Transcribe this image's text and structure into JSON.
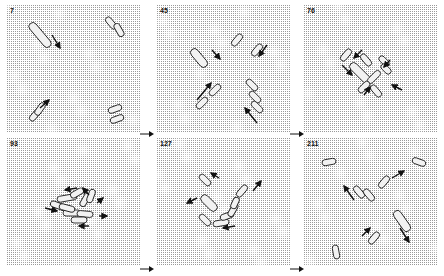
{
  "figure": {
    "background": "#ffffff",
    "stipple_color": "#9a9a9a",
    "cell_stroke": "#222222",
    "arrow_color": "#111111",
    "panels": [
      {
        "label": "7",
        "x": 7,
        "y": 5,
        "cells": [
          {
            "cx": 33,
            "cy": 30,
            "w": 8,
            "h": 30,
            "angle": -40
          },
          {
            "cx": 104,
            "cy": 18,
            "w": 6,
            "h": 14,
            "angle": -40
          },
          {
            "cx": 112,
            "cy": 25,
            "w": 6,
            "h": 14,
            "angle": -30
          },
          {
            "cx": 28,
            "cy": 110,
            "w": 6,
            "h": 14,
            "angle": 40
          },
          {
            "cx": 33,
            "cy": 104,
            "w": 6,
            "h": 14,
            "angle": 35
          },
          {
            "cx": 108,
            "cy": 104,
            "w": 6,
            "h": 14,
            "angle": 70
          },
          {
            "cx": 110,
            "cy": 114,
            "w": 6,
            "h": 14,
            "angle": 70
          }
        ],
        "arrows": [
          {
            "x1": 45,
            "y1": 30,
            "x2": 53,
            "y2": 43
          },
          {
            "x1": 33,
            "y1": 103,
            "x2": 42,
            "y2": 95
          }
        ]
      },
      {
        "label": "45",
        "x": 157,
        "y": 5,
        "cells": [
          {
            "cx": 42,
            "cy": 53,
            "w": 8,
            "h": 22,
            "angle": -40
          },
          {
            "cx": 80,
            "cy": 35,
            "w": 6,
            "h": 14,
            "angle": 40
          },
          {
            "cx": 100,
            "cy": 45,
            "w": 6,
            "h": 14,
            "angle": 40
          },
          {
            "cx": 45,
            "cy": 98,
            "w": 6,
            "h": 14,
            "angle": 45
          },
          {
            "cx": 58,
            "cy": 85,
            "w": 6,
            "h": 14,
            "angle": 45
          },
          {
            "cx": 95,
            "cy": 80,
            "w": 6,
            "h": 14,
            "angle": -45
          },
          {
            "cx": 98,
            "cy": 92,
            "w": 6,
            "h": 14,
            "angle": -45
          },
          {
            "cx": 100,
            "cy": 102,
            "w": 6,
            "h": 14,
            "angle": -45
          }
        ],
        "arrows": [
          {
            "x1": 55,
            "y1": 45,
            "x2": 63,
            "y2": 54
          },
          {
            "x1": 110,
            "y1": 40,
            "x2": 102,
            "y2": 51
          },
          {
            "x1": 40,
            "y1": 95,
            "x2": 54,
            "y2": 78
          },
          {
            "x1": 100,
            "y1": 118,
            "x2": 88,
            "y2": 103
          }
        ]
      },
      {
        "label": "76",
        "x": 304,
        "y": 5,
        "cells": [
          {
            "cx": 56,
            "cy": 68,
            "w": 8,
            "h": 26,
            "angle": -45
          },
          {
            "cx": 42,
            "cy": 50,
            "w": 6,
            "h": 14,
            "angle": 40
          },
          {
            "cx": 62,
            "cy": 55,
            "w": 6,
            "h": 14,
            "angle": -40
          },
          {
            "cx": 70,
            "cy": 72,
            "w": 6,
            "h": 16,
            "angle": 45
          },
          {
            "cx": 60,
            "cy": 82,
            "w": 6,
            "h": 14,
            "angle": 45
          },
          {
            "cx": 72,
            "cy": 86,
            "w": 6,
            "h": 14,
            "angle": -40
          },
          {
            "cx": 80,
            "cy": 56,
            "w": 6,
            "h": 12,
            "angle": -45
          },
          {
            "cx": 82,
            "cy": 64,
            "w": 6,
            "h": 12,
            "angle": -45
          }
        ],
        "arrows": [
          {
            "x1": 38,
            "y1": 60,
            "x2": 48,
            "y2": 70
          },
          {
            "x1": 58,
            "y1": 45,
            "x2": 50,
            "y2": 53
          },
          {
            "x1": 86,
            "y1": 55,
            "x2": 80,
            "y2": 62
          },
          {
            "x1": 98,
            "y1": 85,
            "x2": 88,
            "y2": 80
          },
          {
            "x1": 60,
            "y1": 90,
            "x2": 66,
            "y2": 82
          }
        ]
      },
      {
        "label": "93",
        "x": 7,
        "y": 138,
        "cells": [
          {
            "cx": 60,
            "cy": 60,
            "w": 6,
            "h": 20,
            "angle": 80
          },
          {
            "cx": 52,
            "cy": 68,
            "w": 6,
            "h": 18,
            "angle": -70
          },
          {
            "cx": 70,
            "cy": 55,
            "w": 6,
            "h": 14,
            "angle": 60
          },
          {
            "cx": 78,
            "cy": 62,
            "w": 6,
            "h": 14,
            "angle": 30
          },
          {
            "cx": 84,
            "cy": 58,
            "w": 6,
            "h": 14,
            "angle": 20
          },
          {
            "cx": 65,
            "cy": 75,
            "w": 6,
            "h": 18,
            "angle": 90
          },
          {
            "cx": 78,
            "cy": 76,
            "w": 6,
            "h": 16,
            "angle": 95
          },
          {
            "cx": 72,
            "cy": 82,
            "w": 6,
            "h": 16,
            "angle": 90
          },
          {
            "cx": 60,
            "cy": 70,
            "w": 6,
            "h": 16,
            "angle": -75
          }
        ],
        "arrows": [
          {
            "x1": 70,
            "y1": 50,
            "x2": 58,
            "y2": 52
          },
          {
            "x1": 82,
            "y1": 57,
            "x2": 76,
            "y2": 50
          },
          {
            "x1": 90,
            "y1": 65,
            "x2": 96,
            "y2": 60
          },
          {
            "x1": 38,
            "y1": 70,
            "x2": 50,
            "y2": 73
          },
          {
            "x1": 92,
            "y1": 78,
            "x2": 100,
            "y2": 78
          },
          {
            "x1": 82,
            "y1": 88,
            "x2": 72,
            "y2": 88
          }
        ]
      },
      {
        "label": "127",
        "x": 157,
        "y": 138,
        "cells": [
          {
            "cx": 48,
            "cy": 42,
            "w": 6,
            "h": 14,
            "angle": -45
          },
          {
            "cx": 85,
            "cy": 53,
            "w": 6,
            "h": 14,
            "angle": 40
          },
          {
            "cx": 52,
            "cy": 65,
            "w": 8,
            "h": 20,
            "angle": -45
          },
          {
            "cx": 48,
            "cy": 82,
            "w": 6,
            "h": 14,
            "angle": -45
          },
          {
            "cx": 64,
            "cy": 85,
            "w": 6,
            "h": 16,
            "angle": 80
          },
          {
            "cx": 70,
            "cy": 78,
            "w": 6,
            "h": 14,
            "angle": 70
          },
          {
            "cx": 76,
            "cy": 72,
            "w": 6,
            "h": 14,
            "angle": 30
          },
          {
            "cx": 78,
            "cy": 65,
            "w": 6,
            "h": 12,
            "angle": 25
          }
        ],
        "arrows": [
          {
            "x1": 62,
            "y1": 40,
            "x2": 54,
            "y2": 35
          },
          {
            "x1": 96,
            "y1": 53,
            "x2": 104,
            "y2": 43
          },
          {
            "x1": 40,
            "y1": 60,
            "x2": 30,
            "y2": 65
          },
          {
            "x1": 78,
            "y1": 88,
            "x2": 66,
            "y2": 90
          }
        ]
      },
      {
        "label": "211",
        "x": 304,
        "y": 138,
        "cells": [
          {
            "cx": 25,
            "cy": 24,
            "w": 6,
            "h": 14,
            "angle": 80
          },
          {
            "cx": 115,
            "cy": 24,
            "w": 6,
            "h": 14,
            "angle": -70
          },
          {
            "cx": 80,
            "cy": 44,
            "w": 6,
            "h": 14,
            "angle": 40
          },
          {
            "cx": 55,
            "cy": 54,
            "w": 6,
            "h": 14,
            "angle": -40
          },
          {
            "cx": 65,
            "cy": 57,
            "w": 6,
            "h": 14,
            "angle": -40
          },
          {
            "cx": 98,
            "cy": 83,
            "w": 8,
            "h": 24,
            "angle": -35
          },
          {
            "cx": 70,
            "cy": 100,
            "w": 6,
            "h": 14,
            "angle": 40
          },
          {
            "cx": 32,
            "cy": 114,
            "w": 6,
            "h": 14,
            "angle": -10
          }
        ],
        "arrows": [
          {
            "x1": 88,
            "y1": 40,
            "x2": 100,
            "y2": 33
          },
          {
            "x1": 50,
            "y1": 62,
            "x2": 40,
            "y2": 48
          },
          {
            "x1": 96,
            "y1": 90,
            "x2": 105,
            "y2": 104
          },
          {
            "x1": 58,
            "y1": 98,
            "x2": 66,
            "y2": 90
          }
        ]
      }
    ],
    "step_arrows": [
      {
        "x": 140,
        "y": 128
      },
      {
        "x": 290,
        "y": 128
      },
      {
        "x": 140,
        "y": 263
      },
      {
        "x": 290,
        "y": 263
      }
    ]
  }
}
